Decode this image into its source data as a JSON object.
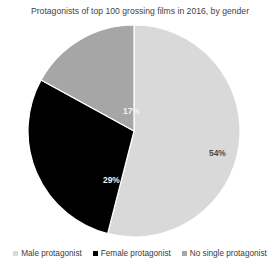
{
  "chart_data": {
    "type": "pie",
    "title": "Protagonists of top 100 grossing films in 2016, by gender",
    "xlabel": "",
    "ylabel": "",
    "legend_position": "bottom",
    "grid": false,
    "categories": [
      "Male protagonist",
      "Female protagonist",
      "No single protagonist"
    ],
    "values": [
      54,
      29,
      17
    ],
    "value_labels": [
      "54%",
      "29%",
      "17%"
    ],
    "colors": [
      "#d9d9d9",
      "#000000",
      "#a6a6a6"
    ],
    "label_colors": [
      "#4a4a4a",
      "#f2f2f2",
      "#f4f4f4"
    ],
    "start_angle_deg": 0,
    "direction": "clockwise",
    "slices": [
      {
        "name": "Male protagonist",
        "value": 54,
        "label": "54%",
        "color": "#d9d9d9"
      },
      {
        "name": "Female protagonist",
        "value": 29,
        "label": "29%",
        "color": "#000000"
      },
      {
        "name": "No single protagonist",
        "value": 17,
        "label": "17%",
        "color": "#a6a6a6"
      }
    ]
  },
  "legend": {
    "items": [
      {
        "label": "Male protagonist",
        "color": "#d9d9d9",
        "swatch_icon": "square-swatch-icon"
      },
      {
        "label": "Female protagonist",
        "color": "#000000",
        "swatch_icon": "square-swatch-icon"
      },
      {
        "label": "No single protagonist",
        "color": "#a6a6a6",
        "swatch_icon": "square-swatch-icon"
      }
    ]
  }
}
